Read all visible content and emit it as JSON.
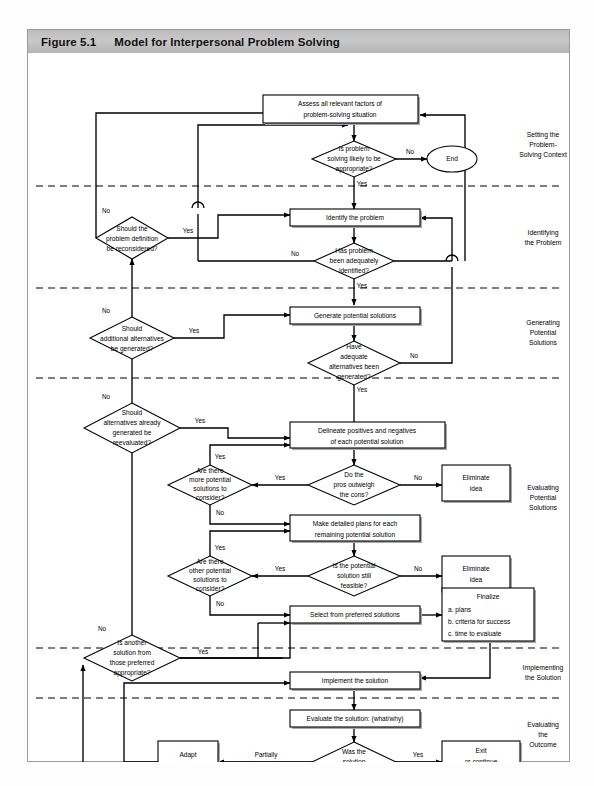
{
  "figure": {
    "number": "Figure 5.1",
    "title": "Model for Interpersonal Problem Solving"
  },
  "sections": [
    {
      "id": "setting",
      "label": "Setting the\nProblem-\nSolving Context"
    },
    {
      "id": "identifying",
      "label": "Identifying\nthe Problem"
    },
    {
      "id": "generating",
      "label": "Generating\nPotential\nSolutions"
    },
    {
      "id": "evaluating",
      "label": "Evaluating\nPotential\nSolutions"
    },
    {
      "id": "implementing",
      "label": "Implementing\nthe Solution"
    },
    {
      "id": "outcome",
      "label": "Evaluating\nthe\nOutcome"
    }
  ],
  "nodes": {
    "assess": {
      "type": "process",
      "label": "Assess all relevant factors of\nproblem-solving situation"
    },
    "is_problem": {
      "type": "decision",
      "label": "Is problem\nsolving likely to be\nappropriate?"
    },
    "end": {
      "type": "terminal",
      "label": "End"
    },
    "should_redefine": {
      "type": "decision",
      "label": "Should the\nproblem definition\nbe reconsidered?"
    },
    "identify": {
      "type": "process",
      "label": "Identify the problem"
    },
    "has_problem": {
      "type": "decision",
      "label": "Has problem\nbeen adequately\nidentified?"
    },
    "should_alt": {
      "type": "decision",
      "label": "Should\nadditional alternatives\nbe generated?"
    },
    "generate": {
      "type": "process",
      "label": "Generate potential solutions"
    },
    "have_adequate": {
      "type": "decision",
      "label": "Have\nadequate\nalternatives been\ngenerated?"
    },
    "should_reeval": {
      "type": "decision",
      "label": "Should\nalternatives already\ngenerated be\nreevaluated?"
    },
    "delineate": {
      "type": "process",
      "label": "Delineate positives and negatives\nof each potential solution"
    },
    "more_potential": {
      "type": "decision",
      "label": "Are there\nmore potential\nsolutions to\nconsider?"
    },
    "pros_cons": {
      "type": "decision",
      "label": "Do the\npros outweigh\nthe cons?"
    },
    "eliminate1": {
      "type": "process",
      "label": "Eliminate\nidea"
    },
    "make_plans": {
      "type": "process",
      "label": "Make detailed plans for each\nremaining potential solution"
    },
    "other_potential": {
      "type": "decision",
      "label": "Are there\nother potential\nsolutions to\nconsider?"
    },
    "still_feasible": {
      "type": "decision",
      "label": "Is the potential\nsolution still\nfeasible?"
    },
    "eliminate2": {
      "type": "process",
      "label": "Eliminate\nidea"
    },
    "is_another": {
      "type": "decision",
      "label": "Is another\nsolution from\nthose  preferred\nappropriate?"
    },
    "select": {
      "type": "process",
      "label": "Select from preferred solutions"
    },
    "finalize": {
      "type": "process-list",
      "title": "Finalize",
      "items": [
        "a. plans",
        "b. criteria for success",
        "c. time to evaluate"
      ]
    },
    "implement": {
      "type": "process",
      "label": "Implement the solution"
    },
    "evaluate": {
      "type": "process",
      "label": "Evaluate the solution: (what/why)"
    },
    "was_successful": {
      "type": "decision",
      "label": "Was the\nsolution\nsuccessful?"
    },
    "adapt": {
      "type": "process",
      "label": "Adapt\nsolution"
    },
    "exit": {
      "type": "process",
      "label": "Exit\nor continue\nimplementation"
    }
  },
  "edge_labels": {
    "no_1": "No",
    "yes_1": "Yes",
    "no_2": "No",
    "yes_2": "Yes",
    "no_3": "No",
    "yes_3": "Yes",
    "no_4": "No",
    "yes_4": "Yes",
    "no_5": "No",
    "yes_5": "Yes",
    "no_6": "No",
    "yes_6": "Yes",
    "no_7": "No",
    "yes_7": "Yes",
    "no_8": "No",
    "yes_8": "Yes",
    "no_9": "No",
    "yes_9": "Yes",
    "no_10": "No",
    "yes_10": "Yes",
    "no_11": "No",
    "yes_11": "Yes",
    "partially": "Partially"
  },
  "colors": {
    "header_band": "#bdbdbd",
    "line": "#000000",
    "box_fill": "#ffffff",
    "shadow": "#a8a8a8",
    "frame": "#9a9a9a"
  }
}
